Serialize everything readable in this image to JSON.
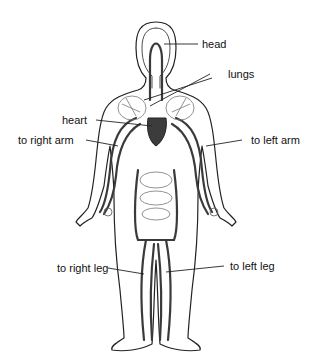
{
  "diagram": {
    "labels": {
      "head": "head",
      "lungs": "lungs",
      "heart": "heart",
      "right_arm": "to right arm",
      "left_arm": "to left arm",
      "right_leg": "to right leg",
      "left_leg": "to left leg"
    },
    "colors": {
      "vessel": "#3a3a3a",
      "outline": "#222222",
      "heart": "#3c3c3c",
      "organ": "#777777"
    }
  }
}
